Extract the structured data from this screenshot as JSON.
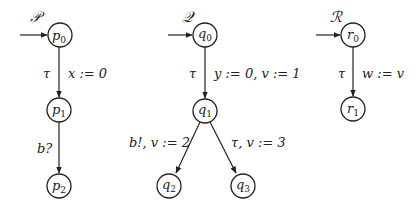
{
  "diagram": {
    "type": "automata",
    "automata": [
      {
        "name": "𝒫",
        "initial": "p0",
        "states": [
          {
            "id": "p0",
            "base": "p",
            "sub": "0",
            "x": 60,
            "y": 35
          },
          {
            "id": "p1",
            "base": "p",
            "sub": "1",
            "x": 59,
            "y": 110
          },
          {
            "id": "p2",
            "base": "p",
            "sub": "2",
            "x": 59,
            "y": 186
          }
        ],
        "transitions": [
          {
            "from": "p0",
            "to": "p1",
            "action": "τ",
            "update": "x := 0"
          },
          {
            "from": "p1",
            "to": "p2",
            "action": "b?",
            "update": ""
          }
        ]
      },
      {
        "name": "𝒬",
        "initial": "q0",
        "states": [
          {
            "id": "q0",
            "base": "q",
            "sub": "0",
            "x": 205,
            "y": 35
          },
          {
            "id": "q1",
            "base": "q",
            "sub": "1",
            "x": 205,
            "y": 111
          },
          {
            "id": "q2",
            "base": "q",
            "sub": "2",
            "x": 169,
            "y": 186
          },
          {
            "id": "q3",
            "base": "q",
            "sub": "3",
            "x": 243,
            "y": 186
          }
        ],
        "transitions": [
          {
            "from": "q0",
            "to": "q1",
            "action": "τ",
            "update": "y := 0, v := 1"
          },
          {
            "from": "q1",
            "to": "q2",
            "action": "b!, v := 2",
            "update": ""
          },
          {
            "from": "q1",
            "to": "q3",
            "action": "τ, v := 3",
            "update": ""
          }
        ]
      },
      {
        "name": "ℛ",
        "initial": "r0",
        "states": [
          {
            "id": "r0",
            "base": "r",
            "sub": "0",
            "x": 353,
            "y": 35
          },
          {
            "id": "r1",
            "base": "r",
            "sub": "1",
            "x": 353,
            "y": 109
          }
        ],
        "transitions": [
          {
            "from": "r0",
            "to": "r1",
            "action": "τ",
            "update": "w := v"
          }
        ]
      }
    ]
  },
  "labels": {
    "P": "𝒫",
    "Q": "𝒬",
    "R": "ℛ",
    "p_base": "p",
    "q_base": "q",
    "r_base": "r",
    "s0": "0",
    "s1": "1",
    "s2": "2",
    "s3": "3",
    "tau": "τ",
    "x_update": "x := 0",
    "b_recv": "b?",
    "y_update": "y := 0, v := 1",
    "b_send": "b!, v := 2",
    "tau_v3": "τ, v := 3",
    "w_update": "w := v"
  },
  "colors": {
    "stroke": "#222222",
    "background": "#ffffff"
  }
}
